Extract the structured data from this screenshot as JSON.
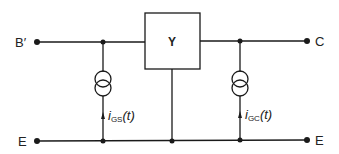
{
  "diagram": {
    "type": "equivalent-circuit",
    "block": {
      "label": "Y"
    },
    "terminals": {
      "input_top": "B′",
      "input_bottom": "E",
      "output_top": "C",
      "output_bottom": "E"
    },
    "sources": [
      {
        "name": "left-current-source",
        "symbol": "i",
        "subscript": "GS",
        "arg": "(t)"
      },
      {
        "name": "right-current-source",
        "symbol": "i",
        "subscript": "GC",
        "arg": "(t)"
      }
    ],
    "colors": {
      "line": "#1a1a1a",
      "background": "#ffffff"
    }
  }
}
